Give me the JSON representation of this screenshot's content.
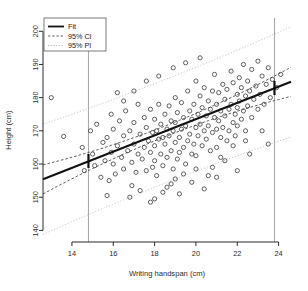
{
  "chart_data": {
    "type": "scatter",
    "title": "",
    "xlabel": "Writing handspan (cm)",
    "ylabel": "Height (cm)",
    "xlim": [
      12.6,
      24.6
    ],
    "ylim": [
      136.5,
      204.0
    ],
    "xticks": [
      14,
      16,
      18,
      20,
      22,
      24
    ],
    "yticks": [
      140,
      150,
      160,
      170,
      180,
      190,
      200
    ],
    "grid": false,
    "legend_position": "top-left",
    "legend": [
      {
        "label": "Fit",
        "style": "solid",
        "color": "#111111"
      },
      {
        "label": "95% CI",
        "style": "dashed",
        "color": "#555555"
      },
      {
        "label": "95% PI",
        "style": "dotted",
        "color": "#b0b0b0"
      }
    ],
    "fit": {
      "slope": 2.45,
      "intercept": 124.5,
      "x_start": 12.6,
      "x_end": 24.6,
      "y_start": 155.4,
      "y_end": 184.8
    },
    "ci_band": {
      "half_width_center": 1.6,
      "half_width_edge": 4.4,
      "x_center": 18.6
    },
    "pi_band": {
      "half_width_center": 15.6,
      "half_width_edge": 16.6,
      "x_center": 18.6
    },
    "markers": {
      "shape": "open-circle",
      "radius": 2.1,
      "color": "#3a3a3a"
    },
    "reference_lines": [
      {
        "x": 14.8,
        "color": "#9a9a9a",
        "marker_y": 160.9
      },
      {
        "x": 23.8,
        "color": "#9a9a9a",
        "marker_y": 182.9
      }
    ],
    "points": [
      [
        13.0,
        180.0
      ],
      [
        13.6,
        168.3
      ],
      [
        14.5,
        165.0
      ],
      [
        14.6,
        158.0
      ],
      [
        14.9,
        170.0
      ],
      [
        15.0,
        163.0
      ],
      [
        15.1,
        159.5
      ],
      [
        15.2,
        172.0
      ],
      [
        15.4,
        156.0
      ],
      [
        15.5,
        166.5
      ],
      [
        15.6,
        161.0
      ],
      [
        15.7,
        168.0
      ],
      [
        15.8,
        155.0
      ],
      [
        15.9,
        163.5
      ],
      [
        16.0,
        170.5
      ],
      [
        16.0,
        160.0
      ],
      [
        16.1,
        157.0
      ],
      [
        16.2,
        165.5
      ],
      [
        16.3,
        173.0
      ],
      [
        16.4,
        162.0
      ],
      [
        16.5,
        168.5
      ],
      [
        16.5,
        158.5
      ],
      [
        16.6,
        176.0
      ],
      [
        16.7,
        164.0
      ],
      [
        16.8,
        170.0
      ],
      [
        16.9,
        160.5
      ],
      [
        17.0,
        166.0
      ],
      [
        17.0,
        172.5
      ],
      [
        17.1,
        157.5
      ],
      [
        17.2,
        163.0
      ],
      [
        17.2,
        178.0
      ],
      [
        17.3,
        169.0
      ],
      [
        17.4,
        161.5
      ],
      [
        17.5,
        174.0
      ],
      [
        17.5,
        165.0
      ],
      [
        17.6,
        158.0
      ],
      [
        17.6,
        171.0
      ],
      [
        17.7,
        167.0
      ],
      [
        17.8,
        163.5
      ],
      [
        17.8,
        176.5
      ],
      [
        17.9,
        159.0
      ],
      [
        17.9,
        169.5
      ],
      [
        18.0,
        173.5
      ],
      [
        18.0,
        165.5
      ],
      [
        18.0,
        161.0
      ],
      [
        18.1,
        170.0
      ],
      [
        18.1,
        156.5
      ],
      [
        18.2,
        167.5
      ],
      [
        18.2,
        178.0
      ],
      [
        18.3,
        163.0
      ],
      [
        18.3,
        172.0
      ],
      [
        18.4,
        168.0
      ],
      [
        18.4,
        159.5
      ],
      [
        18.5,
        175.0
      ],
      [
        18.5,
        166.0
      ],
      [
        18.6,
        170.5
      ],
      [
        18.6,
        162.0
      ],
      [
        18.7,
        177.5
      ],
      [
        18.7,
        168.5
      ],
      [
        18.8,
        164.0
      ],
      [
        18.8,
        173.0
      ],
      [
        18.9,
        158.5
      ],
      [
        18.9,
        170.0
      ],
      [
        19.0,
        180.0
      ],
      [
        19.0,
        166.5
      ],
      [
        19.0,
        172.5
      ],
      [
        19.1,
        161.5
      ],
      [
        19.1,
        175.5
      ],
      [
        19.2,
        168.0
      ],
      [
        19.2,
        163.5
      ],
      [
        19.3,
        178.5
      ],
      [
        19.3,
        170.5
      ],
      [
        19.4,
        165.0
      ],
      [
        19.4,
        174.0
      ],
      [
        19.5,
        160.0
      ],
      [
        19.5,
        171.5
      ],
      [
        19.6,
        182.0
      ],
      [
        19.6,
        167.0
      ],
      [
        19.7,
        176.0
      ],
      [
        19.7,
        169.0
      ],
      [
        19.8,
        163.0
      ],
      [
        19.8,
        173.5
      ],
      [
        19.9,
        178.0
      ],
      [
        19.9,
        166.0
      ],
      [
        20.0,
        171.0
      ],
      [
        20.0,
        185.0
      ],
      [
        20.0,
        162.5
      ],
      [
        20.1,
        175.0
      ],
      [
        20.1,
        168.5
      ],
      [
        20.2,
        180.5
      ],
      [
        20.2,
        172.0
      ],
      [
        20.3,
        165.5
      ],
      [
        20.3,
        177.0
      ],
      [
        20.4,
        170.0
      ],
      [
        20.4,
        183.0
      ],
      [
        20.5,
        174.5
      ],
      [
        20.5,
        167.5
      ],
      [
        20.6,
        179.0
      ],
      [
        20.6,
        171.5
      ],
      [
        20.7,
        164.0
      ],
      [
        20.7,
        176.5
      ],
      [
        20.8,
        182.0
      ],
      [
        20.8,
        169.5
      ],
      [
        20.9,
        174.0
      ],
      [
        20.9,
        187.0
      ],
      [
        21.0,
        178.0
      ],
      [
        21.0,
        170.5
      ],
      [
        21.0,
        165.0
      ],
      [
        21.1,
        181.5
      ],
      [
        21.1,
        173.0
      ],
      [
        21.2,
        176.0
      ],
      [
        21.2,
        168.0
      ],
      [
        21.3,
        184.0
      ],
      [
        21.3,
        171.0
      ],
      [
        21.4,
        179.5
      ],
      [
        21.4,
        174.5
      ],
      [
        21.5,
        167.0
      ],
      [
        21.5,
        182.5
      ],
      [
        21.6,
        176.5
      ],
      [
        21.6,
        170.0
      ],
      [
        21.7,
        188.0
      ],
      [
        21.7,
        178.0
      ],
      [
        21.8,
        172.5
      ],
      [
        21.8,
        184.5
      ],
      [
        21.9,
        175.0
      ],
      [
        21.9,
        168.5
      ],
      [
        22.0,
        181.0
      ],
      [
        22.0,
        177.0
      ],
      [
        22.0,
        171.5
      ],
      [
        22.1,
        186.0
      ],
      [
        22.1,
        179.0
      ],
      [
        22.2,
        173.5
      ],
      [
        22.2,
        183.0
      ],
      [
        22.3,
        176.0
      ],
      [
        22.3,
        190.0
      ],
      [
        22.4,
        180.5
      ],
      [
        22.4,
        170.0
      ],
      [
        22.5,
        185.0
      ],
      [
        22.5,
        177.5
      ],
      [
        22.6,
        182.0
      ],
      [
        22.7,
        174.0
      ],
      [
        22.7,
        188.5
      ],
      [
        22.8,
        179.5
      ],
      [
        22.9,
        183.5
      ],
      [
        23.0,
        176.5
      ],
      [
        23.0,
        191.0
      ],
      [
        23.1,
        181.0
      ],
      [
        23.2,
        186.5
      ],
      [
        23.3,
        178.0
      ],
      [
        23.4,
        184.0
      ],
      [
        23.5,
        189.0
      ],
      [
        23.6,
        180.0
      ],
      [
        23.7,
        185.5
      ],
      [
        23.9,
        183.0
      ],
      [
        24.1,
        187.0
      ],
      [
        16.8,
        150.0
      ],
      [
        17.3,
        152.0
      ],
      [
        18.0,
        149.5
      ],
      [
        18.6,
        153.0
      ],
      [
        19.2,
        151.0
      ],
      [
        19.8,
        154.5
      ],
      [
        20.4,
        152.5
      ],
      [
        21.0,
        156.0
      ],
      [
        17.0,
        182.0
      ],
      [
        17.6,
        185.0
      ],
      [
        18.2,
        186.5
      ],
      [
        18.9,
        189.0
      ],
      [
        19.5,
        190.5
      ],
      [
        20.2,
        192.0
      ],
      [
        16.5,
        179.0
      ],
      [
        15.9,
        175.0
      ],
      [
        16.2,
        181.5
      ],
      [
        20.8,
        159.0
      ],
      [
        21.4,
        161.0
      ],
      [
        22.0,
        158.0
      ],
      [
        22.6,
        163.0
      ],
      [
        21.8,
        165.5
      ],
      [
        20.6,
        156.5
      ],
      [
        19.4,
        157.0
      ],
      [
        18.8,
        154.0
      ],
      [
        17.8,
        148.5
      ],
      [
        16.9,
        153.5
      ],
      [
        15.7,
        150.5
      ],
      [
        23.2,
        170.0
      ],
      [
        23.5,
        166.0
      ],
      [
        22.4,
        167.0
      ],
      [
        21.2,
        162.0
      ],
      [
        19.0,
        155.5
      ],
      [
        20.0,
        158.5
      ],
      [
        18.4,
        151.5
      ]
    ]
  }
}
